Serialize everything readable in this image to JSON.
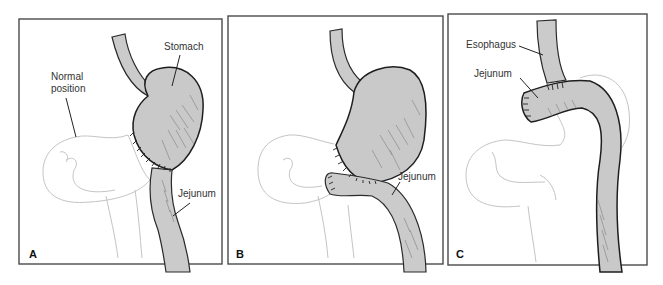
{
  "figure": {
    "panels": [
      {
        "letter": "A",
        "labels": {
          "stomach": "Stomach",
          "normal_position": [
            "Normal",
            "position"
          ],
          "jejunum": "Jejunum"
        }
      },
      {
        "letter": "B",
        "labels": {
          "jejunum": "Jejunum"
        }
      },
      {
        "letter": "C",
        "labels": {
          "esophagus": "Esophagus",
          "jejunum": "Jejunum"
        }
      }
    ],
    "colors": {
      "organ_fill": "#c9c9c9",
      "outline": "#1e1e1e",
      "ghost_outline": "#c4c4c4",
      "frame": "#4a4a4a"
    }
  }
}
